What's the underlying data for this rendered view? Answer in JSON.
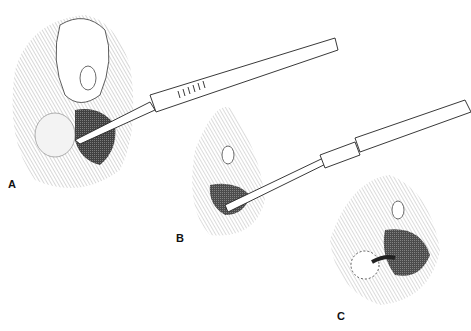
{
  "figure": {
    "panels": [
      {
        "id": "A",
        "label": "A",
        "content": "scalpel incision"
      },
      {
        "id": "B",
        "label": "B",
        "content": "catheter insertion"
      },
      {
        "id": "C",
        "label": "C",
        "content": "catheter in place"
      }
    ],
    "colors": {
      "ink": "#1a1a1a",
      "background": "#ffffff"
    }
  }
}
